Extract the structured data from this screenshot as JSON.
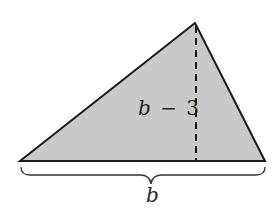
{
  "figure": {
    "shape": "triangle",
    "fill_color": "#c8c8c8",
    "stroke_color": "#1a1a1a",
    "height_label": {
      "var": "b",
      "op": "−",
      "num": "3"
    },
    "base_label": "b"
  }
}
